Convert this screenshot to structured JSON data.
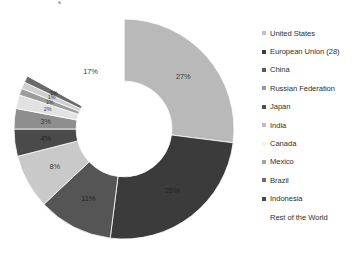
{
  "chart_data": {
    "type": "pie",
    "variant": "donut",
    "title": "",
    "subtitle": "",
    "xlabel": "",
    "ylabel": "",
    "units": "percent",
    "start_angle_deg": 0,
    "direction": "clockwise",
    "inner_radius_ratio": 0.435,
    "legend_position": "right",
    "grid": false,
    "categories": [
      "United States",
      "European Union (28)",
      "China",
      "India",
      "Japan",
      "Russian Federation",
      "Canada",
      "Mexico",
      "Brazil",
      "Indonesia",
      "Rest of the World"
    ],
    "values": [
      27,
      25,
      11,
      8,
      4,
      3,
      2,
      1,
      1,
      1,
      17
    ],
    "data_labels": [
      "27%",
      "25%",
      "11%",
      "8%",
      "4%",
      "3%",
      "2%",
      "1%",
      "1%",
      "1%",
      "17%"
    ],
    "colors": [
      "#b9b9b9",
      "#3b3b3b",
      "#555555",
      "#c9c9c9",
      "#4a4a4a",
      "#8e8e8e",
      "#e2e2e2",
      "#9c9c9c",
      "#cfcfcf",
      "#6a6a6a",
      "#ffffff"
    ]
  },
  "legend": {
    "items": [
      {
        "label": "United States",
        "marker_color": "#c2c2c2"
      },
      {
        "label": "European Union (28)",
        "marker_color": "#3d3d3d"
      },
      {
        "label": "China",
        "marker_color": "#585858"
      },
      {
        "label": "Russian Federation",
        "marker_color": "#9a9a9a"
      },
      {
        "label": "Japan",
        "marker_color": "#4e4e4e"
      },
      {
        "label": "India",
        "marker_color": "#bdbdbd"
      },
      {
        "label": "Canada",
        "marker_color": "#f2f2f2"
      },
      {
        "label": "Mexico",
        "marker_color": "#a4a4a4"
      },
      {
        "label": "Brazil",
        "marker_color": "#6f6f6f"
      },
      {
        "label": "Indonesia",
        "marker_color": "#4a4a4a"
      },
      {
        "label": "Rest of the World",
        "marker_color": "#ffffff"
      }
    ]
  }
}
